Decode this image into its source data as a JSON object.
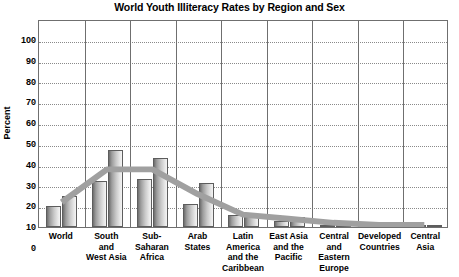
{
  "chart_data": {
    "type": "bar",
    "title": "World Youth Illiteracy Rates by Region and Sex",
    "xlabel": "",
    "ylabel": "Percent",
    "ylim": [
      0,
      100
    ],
    "ytick_step": 10,
    "ytick_labels": [
      "100",
      "90",
      "80",
      "70",
      "60",
      "50",
      "40",
      "30",
      "20",
      "10",
      "0"
    ],
    "grid": "horizontal-dotted",
    "legend": "none",
    "categories": [
      "World",
      "South and West Asia",
      "Sub-Saharan Africa",
      "Arab States",
      "Latin America and the Caribbean",
      "East Asia and the Pacific",
      "Central and Eastern Europe",
      "Developed Countries",
      "Central Asia"
    ],
    "category_label_lines": [
      [
        "World"
      ],
      [
        "South",
        "and",
        "West Asia"
      ],
      [
        "Sub-",
        "Saharan",
        "Africa"
      ],
      [
        "Arab",
        "States"
      ],
      [
        "Latin",
        "America",
        "and the",
        "Caribbean"
      ],
      [
        "East Asia",
        "and the",
        "Pacific"
      ],
      [
        "Central",
        "and",
        "Eastern",
        "Europe"
      ],
      [
        "Developed",
        "Countries"
      ],
      [
        "Central",
        "Asia"
      ]
    ],
    "series": [
      {
        "name": "Male",
        "values": [
          10,
          22,
          23,
          11,
          6,
          3,
          1,
          1,
          1
        ]
      },
      {
        "name": "Female",
        "values": [
          15,
          37,
          33,
          21,
          5,
          5,
          1,
          1,
          1
        ]
      }
    ],
    "trend": {
      "name": "Total",
      "values": [
        12,
        28,
        28,
        16,
        6,
        4,
        2,
        1,
        1
      ]
    },
    "colors": {
      "bar_dark": "#6e6e6e",
      "bar_light": "#f4f4f4",
      "bar_border": "#5d5d5d",
      "trend_line": "#a0a0a0",
      "gridline": "#8a8a8a",
      "axis": "#6f6f6f",
      "text": "#000000",
      "background": "#ffffff"
    }
  }
}
